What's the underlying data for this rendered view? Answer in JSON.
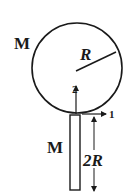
{
  "diagram": {
    "sphere": {
      "mass_label": "M",
      "radius_label": "R"
    },
    "rod": {
      "mass_label": "M",
      "length_label": "2R"
    },
    "axes": [
      {
        "id": "2",
        "label": "2",
        "direction": "up"
      },
      {
        "id": "1",
        "label": "1",
        "direction": "right"
      }
    ],
    "colors": {
      "stroke": "#1a1a1a",
      "background": "#ffffff"
    }
  }
}
